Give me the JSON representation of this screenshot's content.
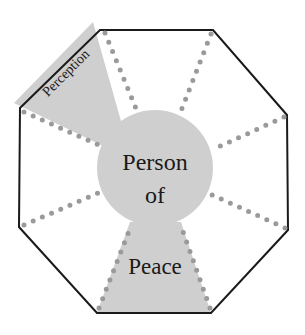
{
  "diagram": {
    "center_label_line1": "Person",
    "center_label_line2": "of",
    "bottom_label": "Peace",
    "wedge_label": "Perception",
    "colors": {
      "outline": "#1a1a1a",
      "fill": "#cfcfcf",
      "dots": "#9a9a9a",
      "text": "#1a1a1a",
      "background": "#ffffff"
    },
    "octagon_vertices": [
      [
        100,
        30
      ],
      [
        213,
        30
      ],
      [
        287,
        115
      ],
      [
        288,
        230
      ],
      [
        211,
        313
      ],
      [
        97,
        313
      ],
      [
        19,
        227
      ],
      [
        20,
        108
      ]
    ],
    "center_circle": {
      "cx": 155,
      "cy": 168,
      "r": 58
    }
  }
}
